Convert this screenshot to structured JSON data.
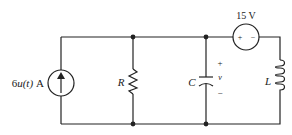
{
  "diagram": {
    "type": "circuit-schematic",
    "background": "#ffffff",
    "line_color": "#222222",
    "components": [
      {
        "id": "current-source",
        "kind": "current_source",
        "label_main": "6",
        "label_var": "u(t)",
        "label_unit": "A",
        "direction": "up"
      },
      {
        "id": "resistor",
        "kind": "resistor",
        "label": "R"
      },
      {
        "id": "capacitor",
        "kind": "capacitor",
        "label": "C",
        "voltage_label": "v",
        "plus": "+",
        "minus": "−"
      },
      {
        "id": "voltage-source",
        "kind": "voltage_source",
        "label": "15 V",
        "plus": "+",
        "minus": "−"
      },
      {
        "id": "inductor",
        "kind": "inductor",
        "label": "L"
      }
    ],
    "nodes": [
      "top-R",
      "top-C",
      "bottom-R",
      "bottom-C"
    ]
  }
}
